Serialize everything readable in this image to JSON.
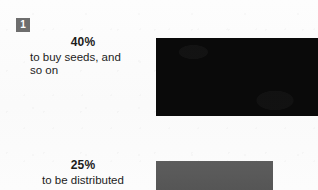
{
  "page": {
    "background_color": "#fcfcfc",
    "text_color": "#1b1b1b"
  },
  "step_badge": {
    "label": "1",
    "background_color": "#6e6e6e",
    "text_color": "#ffffff"
  },
  "callouts": [
    {
      "percent": "40%",
      "description": "to buy seeds, and\nso on"
    },
    {
      "percent": "25%",
      "description": "to be distributed"
    }
  ],
  "chart_data": {
    "type": "bar",
    "title": "",
    "xlabel": "",
    "ylabel": "",
    "orientation": "horizontal",
    "categories": [
      "to buy seeds, and so on",
      "to be distributed"
    ],
    "values": [
      40,
      25
    ],
    "value_labels": [
      "40%",
      "25%"
    ],
    "units": "percent",
    "xlim": [
      0,
      55
    ],
    "grid": false,
    "legend": false,
    "colors": [
      "#0a0a0a",
      "#575757"
    ]
  }
}
